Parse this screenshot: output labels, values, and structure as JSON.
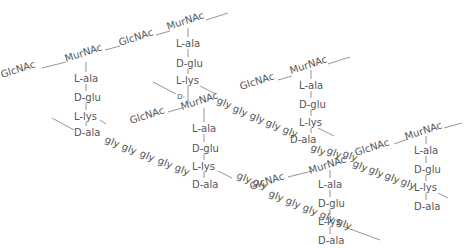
{
  "diagram": {
    "colors": {
      "text": "#555555",
      "line": "#7a7a7a",
      "background": "#ffffff"
    },
    "sugars": {
      "glcnac": "GlcNAc",
      "murnac": "MurNAc"
    },
    "stem_peptide": [
      "L-ala",
      "D-glu",
      "L-lys",
      "D-ala"
    ],
    "bridge_unit": "gly",
    "bridge_length": 5,
    "labels": [
      {
        "id": "s1",
        "text": "GlcNAc",
        "x": 2,
        "y": 78,
        "rot": -18
      },
      {
        "id": "s2",
        "text": "MurNAc",
        "x": 66,
        "y": 60,
        "rot": -18
      },
      {
        "id": "s3",
        "text": "GlcNAc",
        "x": 118,
        "y": 44,
        "rot": -18
      },
      {
        "id": "s4",
        "text": "MurNAc",
        "x": 168,
        "y": 28,
        "rot": -18
      },
      {
        "id": "s5",
        "text": "GlcNAc",
        "x": 130,
        "y": 122,
        "rot": -18
      },
      {
        "id": "s6",
        "text": "MurNAc",
        "x": 180,
        "y": 108,
        "rot": -18
      },
      {
        "id": "s7",
        "text": "GlcNAc",
        "x": 240,
        "y": 88,
        "rot": -18
      },
      {
        "id": "s8",
        "text": "MurNAc",
        "x": 290,
        "y": 72,
        "rot": -18
      },
      {
        "id": "s9",
        "text": "GlcNAc",
        "x": 250,
        "y": 188,
        "rot": -18
      },
      {
        "id": "s10",
        "text": "MurNAc",
        "x": 310,
        "y": 170,
        "rot": -18
      },
      {
        "id": "s11",
        "text": "GlcNAc",
        "x": 356,
        "y": 153,
        "rot": -18
      },
      {
        "id": "s12",
        "text": "MurNAc",
        "x": 405,
        "y": 137,
        "rot": -18
      }
    ],
    "stems": [
      {
        "id": "A",
        "x": 86,
        "y0": 68,
        "labels": [
          "L-ala",
          "D-glu",
          "L-lys",
          "D-ala"
        ],
        "ys": [
          82,
          101,
          120,
          136
        ]
      },
      {
        "id": "B",
        "x": 188,
        "y0": 32,
        "labels": [
          "L-ala",
          "D-glu",
          "L-lys",
          "D-"
        ],
        "ys": [
          47,
          67,
          84,
          100
        ]
      },
      {
        "id": "C",
        "x": 204,
        "y0": 112,
        "labels": [
          "L-ala",
          "D-glu",
          "L-lys",
          "D-ala"
        ],
        "ys": [
          132,
          152,
          170,
          188
        ]
      },
      {
        "id": "D",
        "x": 311,
        "y0": 75,
        "labels": [
          "L-ala",
          "D-glu",
          "L-lys",
          "D-ala"
        ],
        "ys": [
          89,
          108,
          126,
          143
        ]
      },
      {
        "id": "E",
        "x": 330,
        "y0": 174,
        "labels": [
          "L-ala",
          "D-glu",
          "L-lys",
          "D-ala"
        ],
        "ys": [
          188,
          207,
          225,
          244
        ]
      },
      {
        "id": "F",
        "x": 426,
        "y0": 140,
        "labels": [
          "L-ala",
          "D-glu",
          "L-lys",
          "D-ala"
        ],
        "ys": [
          154,
          173,
          191,
          210
        ]
      }
    ],
    "bridges": [
      {
        "id": "b1",
        "labels": [
          "gly",
          "gly",
          "gly",
          "gly",
          "gly"
        ],
        "xs": [
          104,
          121,
          139,
          157,
          175
        ],
        "ys": [
          142,
          149,
          156,
          163,
          170
        ]
      },
      {
        "id": "b2",
        "labels": [
          "gly",
          "gly",
          "gly",
          "gly",
          "gly"
        ],
        "xs": [
          200,
          218,
          236,
          254,
          272
        ],
        "ys": [
          106,
          113,
          120,
          127,
          134
        ]
      },
      {
        "id": "b3",
        "labels": [
          "gly",
          "gly",
          "gly",
          "gly",
          "gly"
        ],
        "xs": [
          236,
          254,
          272,
          290,
          308
        ],
        "ys": [
          156,
          163,
          170,
          177,
          184
        ]
      },
      {
        "id": "b4",
        "labels": [
          "gly",
          "gly",
          "gly",
          "gly",
          "gly"
        ],
        "xs": [
          268,
          286,
          304,
          322,
          341
        ],
        "ys": [
          195,
          202,
          209,
          216,
          223
        ]
      },
      {
        "id": "b5",
        "labels": [
          "gly",
          "gly",
          "gly",
          "gly",
          "gly"
        ],
        "xs": [
          335,
          353,
          371,
          389,
          407
        ],
        "ys": [
          168,
          172,
          177,
          183,
          190
        ]
      }
    ]
  }
}
